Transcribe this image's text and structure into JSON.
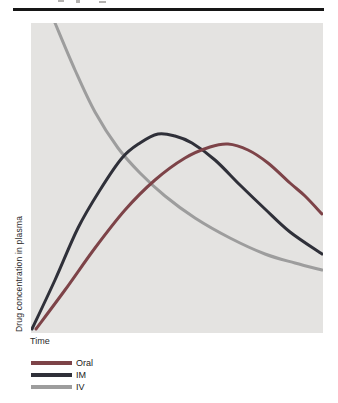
{
  "page": {
    "background": "#ffffff",
    "top_rule_color": "#161616",
    "plot_background": "#e4e3e1"
  },
  "chart_data": {
    "type": "line",
    "title": "",
    "xlabel": "Time",
    "ylabel": "Drug concentration in plasma",
    "x_axis": {
      "ticks": [],
      "note": "unlabeled arbitrary time axis"
    },
    "y_axis": {
      "ticks": [],
      "note": "unlabeled arbitrary concentration axis"
    },
    "grid": false,
    "legend_position": "below-plot-left",
    "series": [
      {
        "name": "Oral",
        "color": "#7d4348",
        "shape": "slow rise to broad peak about 68% across at ~61% of full height, then gentle decline to ~38% at right edge",
        "points_px": [
          [
            5,
            306
          ],
          [
            34,
            267
          ],
          [
            64,
            225
          ],
          [
            94,
            187
          ],
          [
            124,
            157
          ],
          [
            154,
            135
          ],
          [
            179,
            124
          ],
          [
            197,
            121
          ],
          [
            217,
            127
          ],
          [
            237,
            140
          ],
          [
            259,
            160
          ],
          [
            274,
            173
          ],
          [
            291,
            191
          ]
        ]
      },
      {
        "name": "IM",
        "color": "#2f3039",
        "shape": "fast rise from origin to peak about 44% across at ~64% of full height, then steady decline to ~25% at right edge",
        "points_px": [
          [
            1,
            306
          ],
          [
            24,
            257
          ],
          [
            47,
            205
          ],
          [
            69,
            167
          ],
          [
            91,
            135
          ],
          [
            109,
            120
          ],
          [
            127,
            111
          ],
          [
            144,
            113
          ],
          [
            161,
            120
          ],
          [
            184,
            137
          ],
          [
            209,
            162
          ],
          [
            234,
            186
          ],
          [
            259,
            209
          ],
          [
            291,
            231
          ]
        ]
      },
      {
        "name": "IV",
        "color": "#9d9d9d",
        "shape": "starts at maximum at top edge, exponential-like decay flattening to ~20% at right edge",
        "points_px": [
          [
            24,
            0
          ],
          [
            44,
            47
          ],
          [
            64,
            89
          ],
          [
            87,
            125
          ],
          [
            109,
            150
          ],
          [
            134,
            173
          ],
          [
            164,
            195
          ],
          [
            199,
            215
          ],
          [
            234,
            231
          ],
          [
            264,
            240
          ],
          [
            291,
            247
          ]
        ]
      }
    ]
  }
}
